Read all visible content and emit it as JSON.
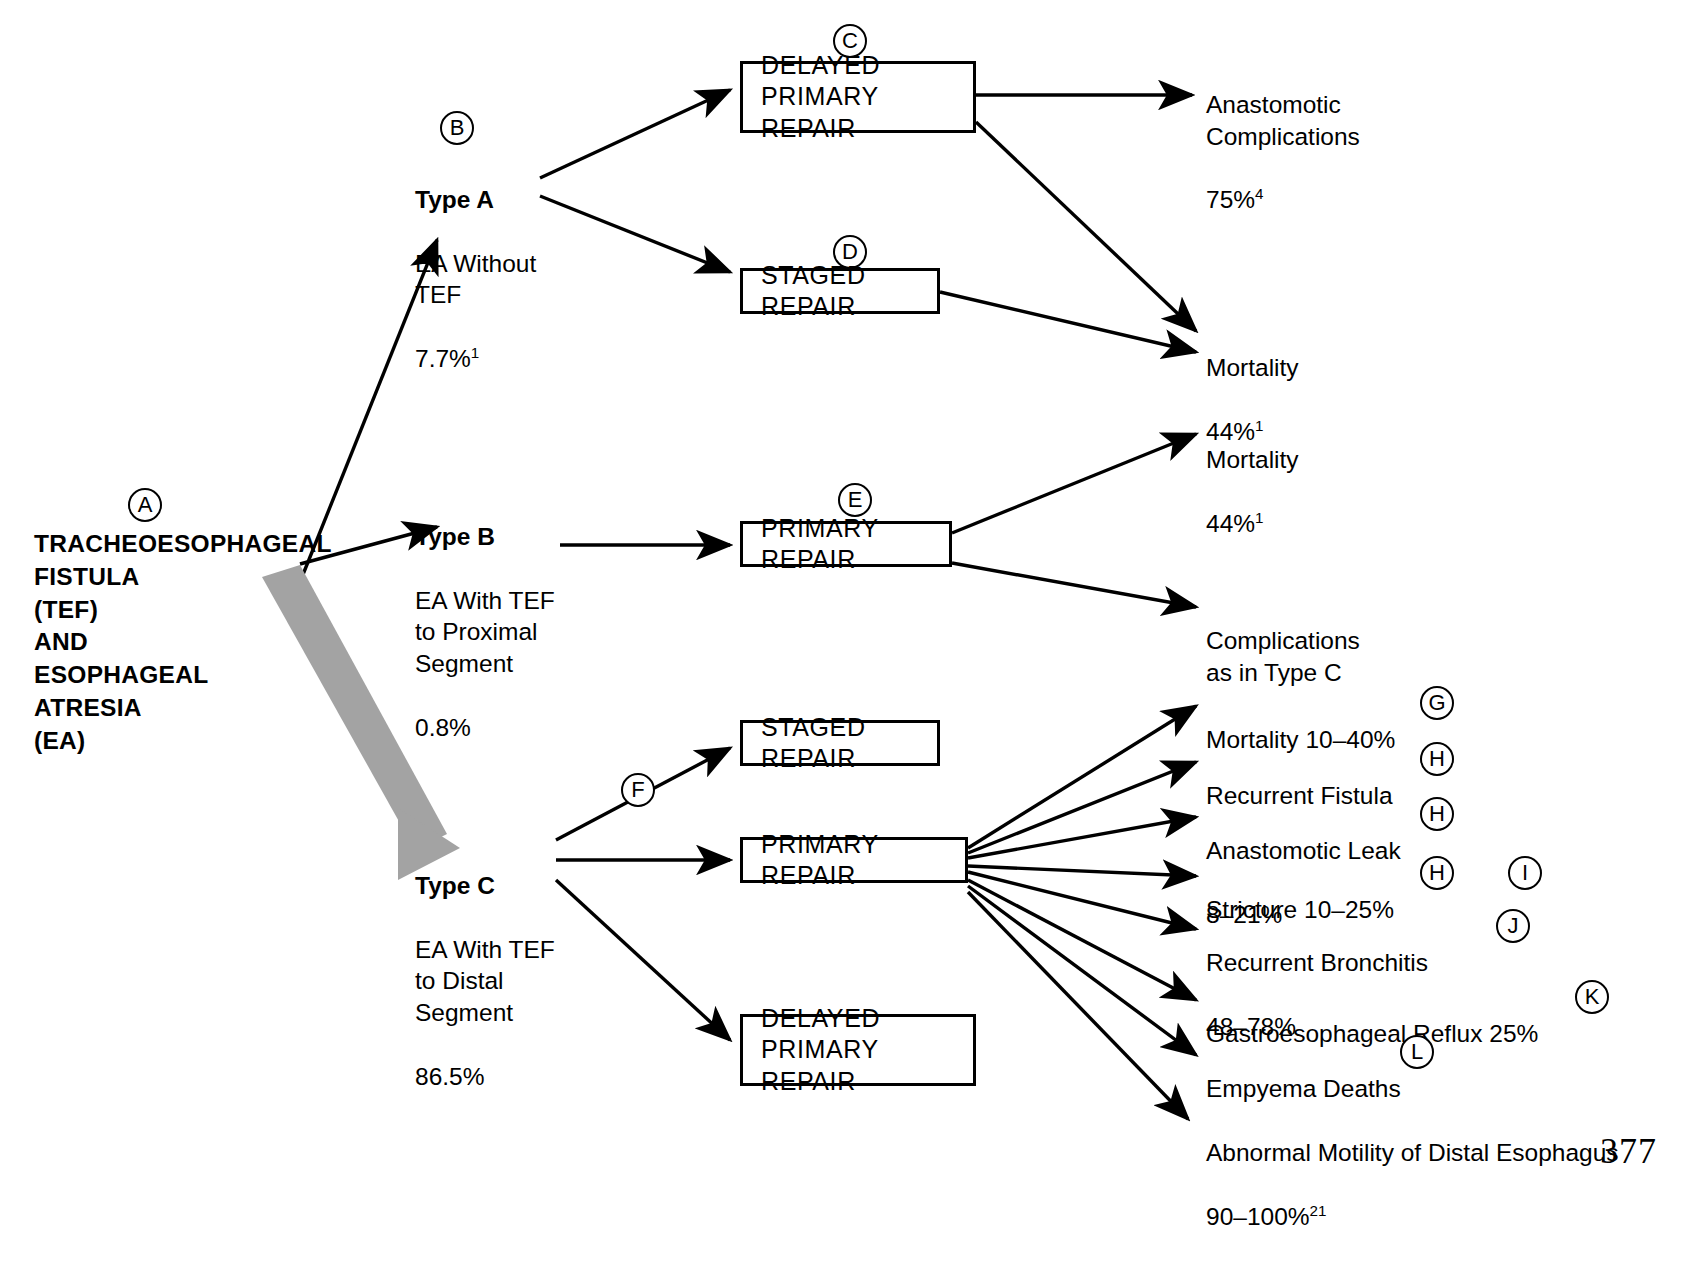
{
  "page": {
    "number": "377"
  },
  "root": {
    "marker": "A",
    "label": "TRACHEOESOPHAGEAL\nFISTULA\n(TEF)\nAND\nESOPHAGEAL\nATRESIA\n(EA)"
  },
  "types": [
    {
      "marker": "B",
      "name": "Type A",
      "body": "EA Without\nTEF",
      "rate": "7.7%",
      "rate_note": "1"
    },
    {
      "marker": null,
      "name": "Type B",
      "body": "EA With TEF\nto Proximal\nSegment",
      "rate": "0.8%",
      "rate_note": ""
    },
    {
      "marker": null,
      "name": "Type C",
      "body": "EA With TEF\nto Distal\nSegment",
      "rate": "86.5%",
      "rate_note": ""
    }
  ],
  "treatments": [
    {
      "id": "delayed-primary-repair-a",
      "marker": "C",
      "label": "DELAYED PRIMARY\nREPAIR"
    },
    {
      "id": "staged-repair-a",
      "marker": "D",
      "label": "STAGED REPAIR"
    },
    {
      "id": "primary-repair-b",
      "marker": "E",
      "label": "PRIMARY REPAIR"
    },
    {
      "id": "staged-repair-c",
      "marker": null,
      "label": "STAGED REPAIR"
    },
    {
      "id": "primary-repair-c",
      "marker": "F",
      "label": "PRIMARY REPAIR"
    },
    {
      "id": "delayed-primary-repair-c",
      "marker": null,
      "label": "DELAYED PRIMARY\nREPAIR"
    }
  ],
  "outcomes": [
    {
      "id": "anastomotic-complications",
      "main": "Anastomotic\nComplications",
      "sub": "75%",
      "sub_note": "4",
      "markers": []
    },
    {
      "id": "mortality-type-a",
      "main": "Mortality",
      "sub": "44%",
      "sub_note": "1",
      "markers": []
    },
    {
      "id": "mortality-type-b",
      "main": "Mortality",
      "sub": "44%",
      "sub_note": "1",
      "markers": []
    },
    {
      "id": "complications-as-in-type-c",
      "main": "Complications\nas in Type C",
      "sub": "",
      "sub_note": "",
      "markers": []
    },
    {
      "id": "mortality-type-c",
      "main": "Mortality 10–40%",
      "sub": "",
      "sub_note": "",
      "markers": [
        "G"
      ]
    },
    {
      "id": "recurrent-fistula",
      "main": "Recurrent Fistula",
      "sub": "",
      "sub_note": "",
      "markers": [
        "H"
      ]
    },
    {
      "id": "anastomotic-leak",
      "main": "Anastomotic Leak",
      "sub": "8–21%",
      "sub_note": "",
      "markers": [
        "H"
      ]
    },
    {
      "id": "stricture",
      "main": "Stricture 10–25%",
      "sub": "",
      "sub_note": "",
      "markers": [
        "H",
        "I"
      ]
    },
    {
      "id": "recurrent-bronchitis",
      "main": "Recurrent Bronchitis",
      "sub": "48–78%",
      "sub_note": "",
      "markers": [
        "J"
      ]
    },
    {
      "id": "gastroesophageal-reflux",
      "main": "Gastroesophageal Reflux 25%",
      "sub": "",
      "sub_note": "",
      "markers": [
        "K"
      ]
    },
    {
      "id": "empyema-deaths",
      "main": "Empyema Deaths",
      "sub": "",
      "sub_note": "",
      "markers": [
        "L"
      ]
    },
    {
      "id": "abnormal-motility",
      "main": "Abnormal Motility of Distal Esophagus",
      "sub": "90–100%",
      "sub_note": "21",
      "markers": []
    }
  ],
  "colors": {
    "ink": "#000000",
    "highlight_arrow": "#a0a0a0",
    "background": "#ffffff"
  }
}
